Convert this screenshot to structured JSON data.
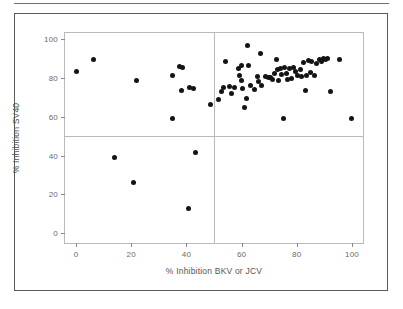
{
  "figure": {
    "background_color": "#ffffff",
    "border_color": "#5a5a5a",
    "frame_color": "#b9b9b9",
    "marker_color": "#141414",
    "tick_label_color": "#6b6b6b",
    "axis_title_color": "#555555"
  },
  "chart_data": {
    "type": "scatter",
    "title": "",
    "xlabel": "% Inhibition BKV or JCV",
    "ylabel": "% Inhibition SV40",
    "xlim": [
      -4,
      104
    ],
    "ylim": [
      -5,
      103
    ],
    "xticks": [
      0,
      20,
      40,
      60,
      80,
      100
    ],
    "yticks": [
      0,
      20,
      40,
      60,
      80,
      100
    ],
    "xtick_labels": [
      "0",
      "20",
      "40",
      "60",
      "80",
      "100"
    ],
    "ytick_labels": [
      "0",
      "20",
      "40",
      "60",
      "80",
      "100"
    ],
    "grid": false,
    "legend": "none",
    "reference_lines": [
      {
        "orientation": "horizontal",
        "value": 50,
        "color": "#b9b9b9"
      },
      {
        "orientation": "vertical",
        "value": 50,
        "color": "#b9b9b9"
      }
    ],
    "marker": {
      "shape": "circle",
      "size": 5,
      "color": "#141414"
    },
    "series": [
      {
        "name": "Samples",
        "points": [
          [
            0.3,
            83.0
          ],
          [
            6.5,
            89.4
          ],
          [
            14.0,
            38.8
          ],
          [
            20.8,
            26.3
          ],
          [
            22.0,
            78.4
          ],
          [
            34.8,
            58.8
          ],
          [
            35.1,
            81.2
          ],
          [
            37.6,
            85.6
          ],
          [
            38.5,
            85.4
          ],
          [
            38.3,
            73.6
          ],
          [
            40.8,
            12.9
          ],
          [
            41.2,
            74.8
          ],
          [
            42.4,
            74.4
          ],
          [
            43.3,
            41.3
          ],
          [
            48.8,
            66.3
          ],
          [
            51.6,
            68.6
          ],
          [
            52.8,
            73.0
          ],
          [
            53.3,
            75.2
          ],
          [
            54.3,
            88.6
          ],
          [
            55.5,
            75.6
          ],
          [
            56.4,
            72.0
          ],
          [
            57.5,
            75.2
          ],
          [
            58.9,
            84.6
          ],
          [
            59.3,
            81.0
          ],
          [
            59.8,
            86.4
          ],
          [
            59.9,
            78.4
          ],
          [
            60.3,
            74.6
          ],
          [
            61.1,
            64.9
          ],
          [
            61.6,
            69.5
          ],
          [
            62.2,
            96.8
          ],
          [
            62.4,
            86.4
          ],
          [
            63.4,
            76.2
          ],
          [
            64.8,
            74.0
          ],
          [
            65.6,
            80.4
          ],
          [
            66.1,
            78.0
          ],
          [
            66.9,
            92.6
          ],
          [
            67.3,
            75.8
          ],
          [
            68.6,
            80.5
          ],
          [
            69.6,
            80.1
          ],
          [
            70.6,
            80.0
          ],
          [
            71.3,
            79.3
          ],
          [
            71.8,
            82.2
          ],
          [
            72.5,
            89.5
          ],
          [
            72.9,
            84.1
          ],
          [
            73.4,
            78.4
          ],
          [
            74.1,
            84.7
          ],
          [
            74.6,
            81.9
          ],
          [
            75.2,
            59.1
          ],
          [
            75.4,
            85.4
          ],
          [
            76.2,
            82.4
          ],
          [
            76.6,
            78.9
          ],
          [
            77.4,
            84.8
          ],
          [
            78.2,
            79.5
          ],
          [
            78.9,
            85.1
          ],
          [
            79.6,
            83.2
          ],
          [
            80.3,
            81.1
          ],
          [
            81.2,
            84.4
          ],
          [
            81.8,
            80.6
          ],
          [
            82.6,
            88.0
          ],
          [
            83.1,
            73.2
          ],
          [
            83.6,
            81.4
          ],
          [
            84.1,
            89.1
          ],
          [
            84.8,
            82.6
          ],
          [
            85.4,
            88.6
          ],
          [
            86.3,
            80.9
          ],
          [
            87.2,
            87.5
          ],
          [
            88.4,
            89.6
          ],
          [
            89.1,
            88.4
          ],
          [
            89.8,
            90.0
          ],
          [
            90.4,
            89.2
          ],
          [
            91.0,
            90.1
          ],
          [
            92.3,
            73.1
          ],
          [
            95.6,
            89.4
          ],
          [
            99.8,
            58.8
          ]
        ]
      }
    ],
    "n_points": 74,
    "quadrant_counts": {
      "upper_left": 9,
      "upper_right": 60,
      "lower_left": 4,
      "lower_right": 0
    }
  }
}
